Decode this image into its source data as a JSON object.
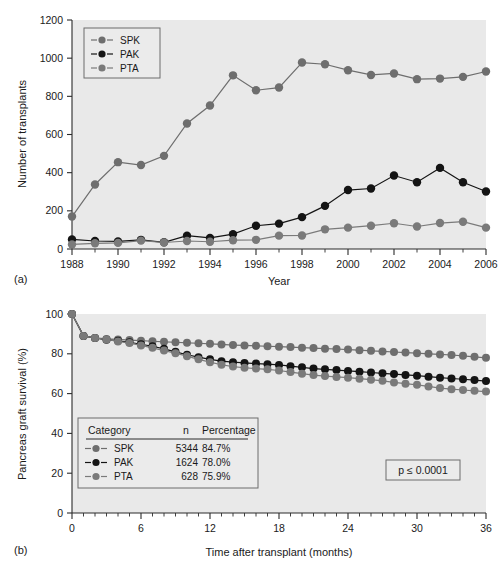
{
  "figure": {
    "colors": {
      "spk": "#6e6e6e",
      "pak": "#141414",
      "pta": "#7a7a7a",
      "plot_background": "#e9e9e9",
      "axis": "#2b2b2b",
      "page_background": "#ffffff"
    }
  },
  "panel_a": {
    "label": "(a)",
    "legend": {
      "items": [
        {
          "label": "SPK",
          "color": "#6e6e6e"
        },
        {
          "label": "PAK",
          "color": "#141414"
        },
        {
          "label": "PTA",
          "color": "#7a7a7a"
        }
      ]
    }
  },
  "panel_b": {
    "label": "(b)",
    "pvalue": "p ≤ 0.0001",
    "legend": {
      "headers": [
        "Category",
        "n",
        "Percentage"
      ],
      "rows": [
        {
          "label": "SPK",
          "n": "5344",
          "percentage": "84.7%",
          "color": "#6e6e6e"
        },
        {
          "label": "PAK",
          "n": "1624",
          "percentage": "78.0%",
          "color": "#141414"
        },
        {
          "label": "PTA",
          "n": "628",
          "percentage": "75.9%",
          "color": "#7a7a7a"
        }
      ]
    }
  },
  "chart_data": [
    {
      "type": "line",
      "id": "panel-a",
      "title": "",
      "xlabel": "Year",
      "ylabel": "Number of transplants",
      "xlim": [
        1988,
        2006
      ],
      "ylim": [
        0,
        1200
      ],
      "xticks": [
        1988,
        1990,
        1992,
        1994,
        1996,
        1998,
        2000,
        2002,
        2004,
        2006
      ],
      "xtick_labels": [
        "1988",
        "1990",
        "1992",
        "1994",
        "1996",
        "1998",
        "2000",
        "2002",
        "2004",
        "2006"
      ],
      "xticks_minor": [
        1989,
        1991,
        1993,
        1995,
        1997,
        1999,
        2001,
        2003,
        2005
      ],
      "yticks": [
        0,
        200,
        400,
        600,
        800,
        1000,
        1200
      ],
      "ytick_labels": [
        "0",
        "200",
        "400",
        "600",
        "800",
        "1000",
        "1200"
      ],
      "grid": false,
      "legend_position": "top-left",
      "x": [
        1988,
        1989,
        1990,
        1991,
        1992,
        1993,
        1994,
        1995,
        1996,
        1997,
        1998,
        1999,
        2000,
        2001,
        2002,
        2003,
        2004,
        2005,
        2006
      ],
      "series": [
        {
          "name": "SPK",
          "color": "#6e6e6e",
          "values": [
            170,
            338,
            455,
            440,
            488,
            658,
            752,
            910,
            832,
            846,
            977,
            968,
            937,
            912,
            920,
            890,
            893,
            902,
            930
          ]
        },
        {
          "name": "PAK",
          "color": "#141414",
          "values": [
            50,
            42,
            40,
            48,
            35,
            70,
            58,
            78,
            122,
            133,
            167,
            226,
            309,
            317,
            385,
            350,
            425,
            350,
            301
          ]
        },
        {
          "name": "PTA",
          "color": "#7a7a7a",
          "values": [
            24,
            30,
            32,
            44,
            34,
            42,
            38,
            46,
            48,
            70,
            71,
            103,
            112,
            122,
            135,
            118,
            136,
            143,
            112
          ]
        }
      ]
    },
    {
      "type": "line",
      "id": "panel-b",
      "title": "",
      "xlabel": "Time after transplant (months)",
      "ylabel": "Pancreas graft survival (%)",
      "xlim": [
        0,
        36
      ],
      "ylim": [
        0,
        100
      ],
      "xticks": [
        0,
        6,
        12,
        18,
        24,
        30,
        36
      ],
      "xtick_labels": [
        "0",
        "6",
        "12",
        "18",
        "24",
        "30",
        "36"
      ],
      "xticks_minor": [
        1,
        2,
        3,
        4,
        5,
        7,
        8,
        9,
        10,
        11,
        13,
        14,
        15,
        16,
        17,
        19,
        20,
        21,
        22,
        23,
        25,
        26,
        27,
        28,
        29,
        31,
        32,
        33,
        34,
        35
      ],
      "yticks": [
        0,
        20,
        40,
        60,
        80,
        100
      ],
      "ytick_labels": [
        "0",
        "20",
        "40",
        "60",
        "80",
        "100"
      ],
      "grid": false,
      "legend_position": "lower-left",
      "x": [
        0,
        1,
        2,
        3,
        4,
        5,
        6,
        7,
        8,
        9,
        10,
        11,
        12,
        13,
        14,
        15,
        16,
        17,
        18,
        19,
        20,
        21,
        22,
        23,
        24,
        25,
        26,
        27,
        28,
        29,
        30,
        31,
        32,
        33,
        34,
        35,
        36
      ],
      "series": [
        {
          "name": "SPK",
          "color": "#6e6e6e",
          "values": [
            100.0,
            89.0,
            88.0,
            87.5,
            87.2,
            86.9,
            86.6,
            86.3,
            86.0,
            85.8,
            85.5,
            85.3,
            85.0,
            84.7,
            84.4,
            84.2,
            84.0,
            83.8,
            83.6,
            83.4,
            83.1,
            82.9,
            82.6,
            82.4,
            82.1,
            81.8,
            81.5,
            81.2,
            80.9,
            80.6,
            80.3,
            80.0,
            79.7,
            79.4,
            79.0,
            78.5,
            78.0
          ]
        },
        {
          "name": "PAK",
          "color": "#141414",
          "values": [
            100.0,
            89.0,
            88.0,
            87.0,
            86.5,
            85.8,
            84.8,
            83.8,
            82.5,
            81.0,
            79.5,
            78.3,
            77.2,
            76.3,
            75.8,
            75.4,
            75.1,
            74.8,
            74.4,
            73.8,
            73.2,
            72.6,
            72.2,
            71.8,
            71.4,
            71.0,
            70.6,
            70.2,
            69.8,
            69.4,
            69.0,
            68.5,
            68.0,
            67.6,
            67.2,
            66.8,
            66.3
          ]
        },
        {
          "name": "PTA",
          "color": "#7a7a7a",
          "values": [
            100.0,
            89.0,
            88.0,
            87.2,
            86.2,
            85.4,
            84.2,
            83.0,
            81.6,
            80.3,
            78.8,
            77.2,
            75.8,
            74.5,
            73.6,
            73.0,
            72.6,
            72.2,
            71.6,
            70.8,
            70.0,
            69.3,
            68.8,
            68.4,
            68.0,
            67.5,
            67.0,
            66.4,
            65.6,
            65.0,
            64.4,
            63.6,
            62.8,
            62.2,
            61.8,
            61.4,
            61.0
          ]
        }
      ]
    }
  ]
}
